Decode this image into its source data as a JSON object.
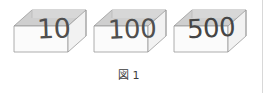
{
  "figure": {
    "caption_label": "図",
    "caption_number": "1",
    "boxes": [
      {
        "number": "10",
        "name": "box-10"
      },
      {
        "number": "100",
        "name": "box-100"
      },
      {
        "number": "500",
        "name": "box-500"
      }
    ]
  },
  "colors": {
    "background": "#ffffff",
    "box_outline": "#9a9a9a",
    "box_top_face": "#cfcfcf",
    "box_inner_back": "#dcdcdc",
    "box_front_face": "#fbfbfb",
    "number_text": "#4f4f4f",
    "caption_text": "#3d3d3d",
    "divider": "#d8d8d8"
  }
}
